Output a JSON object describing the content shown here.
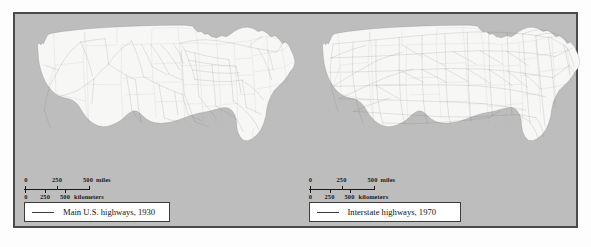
{
  "figure": {
    "background_color": "#bdbdbd",
    "frame_color": "#4a4a4a",
    "land_color": "#f7f7f5",
    "highway_color": "#5d5d5d",
    "state_border_color": "#9a9a9a"
  },
  "maps": [
    {
      "id": "map-1930",
      "legend_label": "Main U.S. highways, 1930",
      "scale": {
        "miles": {
          "unit_label": "miles",
          "ticks": [
            "0",
            "250",
            "500"
          ],
          "values": [
            0,
            250,
            500
          ]
        },
        "kilometers": {
          "unit_label": "kilometers",
          "ticks": [
            "0",
            "250",
            "500"
          ],
          "values": [
            0,
            250,
            500
          ]
        }
      }
    },
    {
      "id": "map-1970",
      "legend_label": "Interstate highways, 1970",
      "scale": {
        "miles": {
          "unit_label": "miles",
          "ticks": [
            "0",
            "250",
            "500"
          ],
          "values": [
            0,
            250,
            500
          ]
        },
        "kilometers": {
          "unit_label": "kilometers",
          "ticks": [
            "0",
            "250",
            "500"
          ],
          "values": [
            0,
            250,
            500
          ]
        }
      }
    }
  ]
}
